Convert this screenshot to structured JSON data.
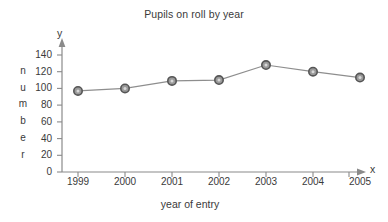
{
  "chart_data": {
    "type": "line",
    "title": "Pupils on roll by year",
    "xlabel": "year of entry",
    "ylabel": "number",
    "categories": [
      "1999",
      "2000",
      "2001",
      "2002",
      "2003",
      "2004",
      "2005"
    ],
    "values": [
      97,
      100,
      109,
      110,
      128,
      120,
      113
    ],
    "yticks": [
      0,
      20,
      40,
      60,
      80,
      100,
      120,
      140
    ],
    "ylim": [
      0,
      148
    ],
    "grid": false,
    "legend": null,
    "axis_letters": {
      "y": "y",
      "x": "x"
    },
    "series_color": "#8e8e8e",
    "marker_edge_color": "#555555",
    "axis_color": "#8a8a8a",
    "text_color": "#3a3a3a"
  },
  "ylabel_chars": [
    "n",
    "u",
    "m",
    "b",
    "e",
    "r"
  ]
}
